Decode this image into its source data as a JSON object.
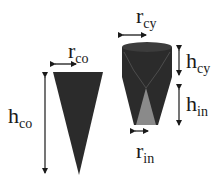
{
  "figure": {
    "cone": {
      "radius_label": {
        "main": "r",
        "sub": "co"
      },
      "height_label": {
        "main": "h",
        "sub": "co"
      },
      "fill_color": "#2b2b2b"
    },
    "cylinder_cone": {
      "radius_label": {
        "main": "r",
        "sub": "cy"
      },
      "cyl_height_label": {
        "main": "h",
        "sub": "cy"
      },
      "inner_height_label": {
        "main": "h",
        "sub": "in"
      },
      "inner_radius_label": {
        "main": "r",
        "sub": "in"
      },
      "fill_color": "#2b2b2b",
      "inner_fill_color": "#8a8a8a"
    }
  }
}
